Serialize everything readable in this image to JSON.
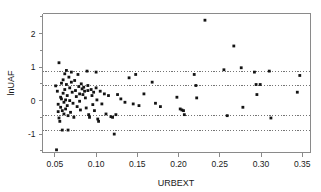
{
  "chart_data": {
    "type": "scatter",
    "title": "",
    "xlabel": "URBEXT",
    "ylabel": "lnUAF",
    "xlim": [
      0.035,
      0.36
    ],
    "ylim": [
      -1.55,
      2.6
    ],
    "grid": false,
    "legend": null,
    "xticks": [
      0.05,
      0.1,
      0.15,
      0.2,
      0.25,
      0.3,
      0.35
    ],
    "xticklabels": [
      "0.05",
      "0.10",
      "0.15",
      "0.20",
      "0.25",
      "0.30",
      "0.35"
    ],
    "yticks": [
      -1,
      0,
      1,
      2
    ],
    "yticklabels": [
      "-1",
      "0",
      "1",
      "2"
    ],
    "yminorticks": [
      -1.5,
      -0.5,
      0.5,
      1.5,
      2.5
    ],
    "reference_lines": {
      "orientation": "horizontal",
      "style": "dotted",
      "values": [
        0.88,
        0.44,
        -0.44,
        -0.88
      ]
    },
    "series": [
      {
        "name": "lnUAF vs URBEXT",
        "marker": "filled-square",
        "color": "#141414",
        "points": [
          [
            0.052,
            -1.47
          ],
          [
            0.055,
            1.13
          ],
          [
            0.051,
            0.44
          ],
          [
            0.053,
            0.28
          ],
          [
            0.054,
            -0.11
          ],
          [
            0.054,
            -0.33
          ],
          [
            0.055,
            -0.52
          ],
          [
            0.056,
            -0.62
          ],
          [
            0.057,
            0.1
          ],
          [
            0.057,
            -0.2
          ],
          [
            0.058,
            0.52
          ],
          [
            0.058,
            0.05
          ],
          [
            0.059,
            -0.3
          ],
          [
            0.059,
            -0.88
          ],
          [
            0.06,
            0.62
          ],
          [
            0.06,
            0.22
          ],
          [
            0.061,
            -0.05
          ],
          [
            0.061,
            -0.4
          ],
          [
            0.062,
            0.8
          ],
          [
            0.062,
            0.33
          ],
          [
            0.063,
            0.02
          ],
          [
            0.063,
            -0.25
          ],
          [
            0.064,
            0.9
          ],
          [
            0.064,
            0.48
          ],
          [
            0.065,
            0.15
          ],
          [
            0.065,
            -0.15
          ],
          [
            0.066,
            -0.45
          ],
          [
            0.066,
            -0.88
          ],
          [
            0.067,
            0.7
          ],
          [
            0.068,
            0.38
          ],
          [
            0.068,
            0.0
          ],
          [
            0.069,
            -0.35
          ],
          [
            0.07,
            0.85
          ],
          [
            0.07,
            0.55
          ],
          [
            0.071,
            0.25
          ],
          [
            0.072,
            -0.08
          ],
          [
            0.073,
            -0.5
          ],
          [
            0.074,
            0.6
          ],
          [
            0.075,
            0.3
          ],
          [
            0.076,
            0.12
          ],
          [
            0.077,
            -0.18
          ],
          [
            0.078,
            0.78
          ],
          [
            0.079,
            0.42
          ],
          [
            0.08,
            0.2
          ],
          [
            0.08,
            -0.02
          ],
          [
            0.081,
            -0.28
          ],
          [
            0.082,
            0.5
          ],
          [
            0.083,
            0.35
          ],
          [
            0.084,
            0.18
          ],
          [
            0.085,
            0.4
          ],
          [
            0.086,
            0.28
          ],
          [
            0.087,
            0.08
          ],
          [
            0.088,
            -0.22
          ],
          [
            0.089,
            0.88
          ],
          [
            0.09,
            0.45
          ],
          [
            0.09,
            0.3
          ],
          [
            0.091,
            -0.42
          ],
          [
            0.092,
            -0.5
          ],
          [
            0.094,
            0.33
          ],
          [
            0.095,
            0.15
          ],
          [
            0.096,
            -0.12
          ],
          [
            0.097,
            0.25
          ],
          [
            0.098,
            -0.3
          ],
          [
            0.1,
            0.85
          ],
          [
            0.1,
            0.38
          ],
          [
            0.101,
            0.02
          ],
          [
            0.102,
            -0.55
          ],
          [
            0.103,
            -0.62
          ],
          [
            0.105,
            0.28
          ],
          [
            0.107,
            -0.1
          ],
          [
            0.11,
            0.2
          ],
          [
            0.112,
            -0.4
          ],
          [
            0.115,
            0.15
          ],
          [
            0.118,
            -0.48
          ],
          [
            0.12,
            -0.5
          ],
          [
            0.122,
            -1.0
          ],
          [
            0.124,
            -0.42
          ],
          [
            0.126,
            0.18
          ],
          [
            0.13,
            0.05
          ],
          [
            0.135,
            -0.05
          ],
          [
            0.14,
            0.68
          ],
          [
            0.145,
            -0.1
          ],
          [
            0.148,
            0.78
          ],
          [
            0.152,
            -0.15
          ],
          [
            0.158,
            0.2
          ],
          [
            0.168,
            0.55
          ],
          [
            0.172,
            -0.08
          ],
          [
            0.178,
            -0.18
          ],
          [
            0.198,
            0.1
          ],
          [
            0.202,
            -0.25
          ],
          [
            0.204,
            -0.28
          ],
          [
            0.206,
            -0.3
          ],
          [
            0.207,
            -0.42
          ],
          [
            0.219,
            0.78
          ],
          [
            0.221,
            0.45
          ],
          [
            0.222,
            0.08
          ],
          [
            0.232,
            2.4
          ],
          [
            0.255,
            0.92
          ],
          [
            0.259,
            -0.45
          ],
          [
            0.267,
            1.63
          ],
          [
            0.276,
            0.98
          ],
          [
            0.278,
            -0.2
          ],
          [
            0.292,
            0.85
          ],
          [
            0.294,
            0.48
          ],
          [
            0.295,
            0.18
          ],
          [
            0.299,
            0.48
          ],
          [
            0.31,
            0.88
          ],
          [
            0.312,
            -0.52
          ],
          [
            0.344,
            0.25
          ],
          [
            0.347,
            0.75
          ]
        ]
      }
    ]
  }
}
